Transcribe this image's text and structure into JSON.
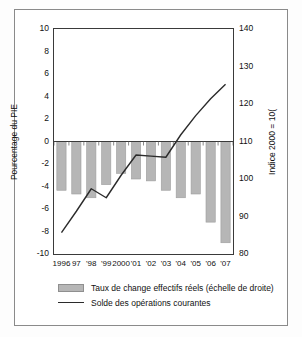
{
  "chart_data": {
    "type": "bar",
    "title": "",
    "subtitle": "",
    "categories": [
      "1996",
      "97",
      "'98",
      "'99",
      "2000",
      "'01",
      "'02",
      "'03",
      "'04",
      "'05",
      "'06",
      "'07"
    ],
    "xlabel": "",
    "ylabel": "Pourcentage du PIE",
    "ylabel_right": "Indice 2000 = 10(",
    "ylim": [
      -10,
      10
    ],
    "yticks": [
      10,
      8,
      6,
      4,
      2,
      0,
      -2,
      -4,
      -6,
      -8,
      -10
    ],
    "ylim_right": [
      80,
      140
    ],
    "yticks_right": [
      140,
      130,
      120,
      110,
      100,
      90,
      80
    ],
    "grid": false,
    "legend_position": "bottom",
    "series": [
      {
        "name": "Taux de change effectifs réels (échelle de droite)",
        "type": "bar",
        "axis": "right",
        "color": "#b6b6b6",
        "values": [
          97.0,
          96.0,
          95.0,
          98.5,
          101.5,
          100.0,
          99.5,
          97.0,
          95.0,
          96.0,
          88.5,
          83.0
        ]
      },
      {
        "name": "Solde des opérations courantes",
        "type": "line",
        "axis": "left",
        "color": "#2b2b2b",
        "values": [
          -8.1,
          -6.2,
          -4.2,
          -5.0,
          -3.0,
          -1.2,
          -1.3,
          -1.4,
          0.6,
          2.3,
          3.8,
          5.1
        ]
      }
    ]
  },
  "legend": {
    "items": [
      {
        "label": "Taux de change effectifs réels (échelle de droite)",
        "marker": "bar-swatch"
      },
      {
        "label": "Solde des opérations courantes",
        "marker": "line-swatch"
      }
    ]
  }
}
